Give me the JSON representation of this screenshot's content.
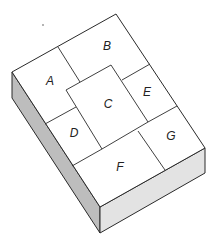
{
  "diagram": {
    "pieces": [
      {
        "id": "A",
        "label": "A",
        "x": 50,
        "y": 82
      },
      {
        "id": "B",
        "label": "B",
        "x": 107,
        "y": 47
      },
      {
        "id": "C",
        "label": "C",
        "x": 108,
        "y": 105
      },
      {
        "id": "D",
        "label": "D",
        "x": 74,
        "y": 134
      },
      {
        "id": "E",
        "label": "E",
        "x": 147,
        "y": 93
      },
      {
        "id": "F",
        "label": "F",
        "x": 120,
        "y": 168
      },
      {
        "id": "G",
        "label": "G",
        "x": 171,
        "y": 137
      }
    ],
    "colors": {
      "line": "#2a2a2a",
      "top": "#ffffff",
      "left_side": "#bdbdbd",
      "front_side": "#e3e3e3"
    }
  }
}
